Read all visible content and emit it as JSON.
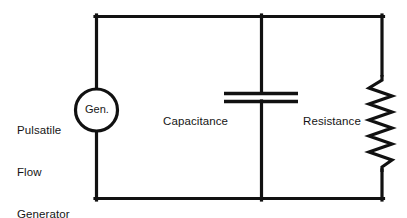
{
  "diagram": {
    "background_color": "#ffffff",
    "stroke_color": "#111111",
    "labels": {
      "generator_external": "Pulsatile\nFlow\nGenerator",
      "generator_external_lines": [
        "Pulsatile",
        "Flow",
        "Generator"
      ],
      "generator_symbol": "Gen.",
      "capacitance": "Capacitance",
      "resistance": "Resistance"
    },
    "components": [
      {
        "name": "pulsatile-flow-generator",
        "symbol_text": "Gen.",
        "label": "Pulsatile Flow Generator",
        "type": "source",
        "shape": "circle",
        "cx": 96,
        "cy": 110,
        "r": 21
      },
      {
        "name": "capacitance",
        "label": "Capacitance",
        "type": "capacitor",
        "branch_x": 261,
        "plate_left_x": 224,
        "plate_right_x": 298,
        "plate_top_y": 93,
        "plate_bottom_y": 101
      },
      {
        "name": "resistance",
        "label": "Resistance",
        "type": "resistor",
        "branch_x": 382,
        "zigzag_top_y": 75,
        "zigzag_bottom_y": 172,
        "zigzag_cycles": 6,
        "zigzag_amplitude": 14
      }
    ],
    "frame": {
      "left_x": 96,
      "right_x": 382,
      "top_y": 15,
      "bottom_y": 200,
      "line_width": 3
    }
  }
}
